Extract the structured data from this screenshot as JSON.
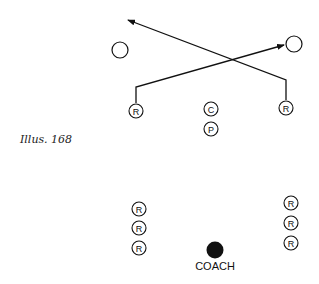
{
  "caption": "Illus. 168",
  "coach_label": "COACH",
  "colors": {
    "ink": "#111111",
    "background": "#ffffff"
  },
  "players": {
    "left_runner": {
      "label": "R",
      "x": 136,
      "y": 111
    },
    "right_runner": {
      "label": "R",
      "x": 286,
      "y": 108
    },
    "center": {
      "label": "C",
      "x": 211,
      "y": 109
    },
    "pitcher": {
      "label": "P",
      "x": 211,
      "y": 129
    },
    "left_line": [
      {
        "label": "R",
        "x": 139,
        "y": 209
      },
      {
        "label": "R",
        "x": 139,
        "y": 228
      },
      {
        "label": "R",
        "x": 139,
        "y": 248
      }
    ],
    "right_line": [
      {
        "label": "R",
        "x": 291,
        "y": 203
      },
      {
        "label": "R",
        "x": 291,
        "y": 223
      },
      {
        "label": "R",
        "x": 291,
        "y": 243
      }
    ]
  },
  "targets": [
    {
      "name": "left-target",
      "x": 120,
      "y": 50
    },
    {
      "name": "right-target",
      "x": 294,
      "y": 44
    }
  ],
  "coach": {
    "x": 215,
    "y": 250
  }
}
